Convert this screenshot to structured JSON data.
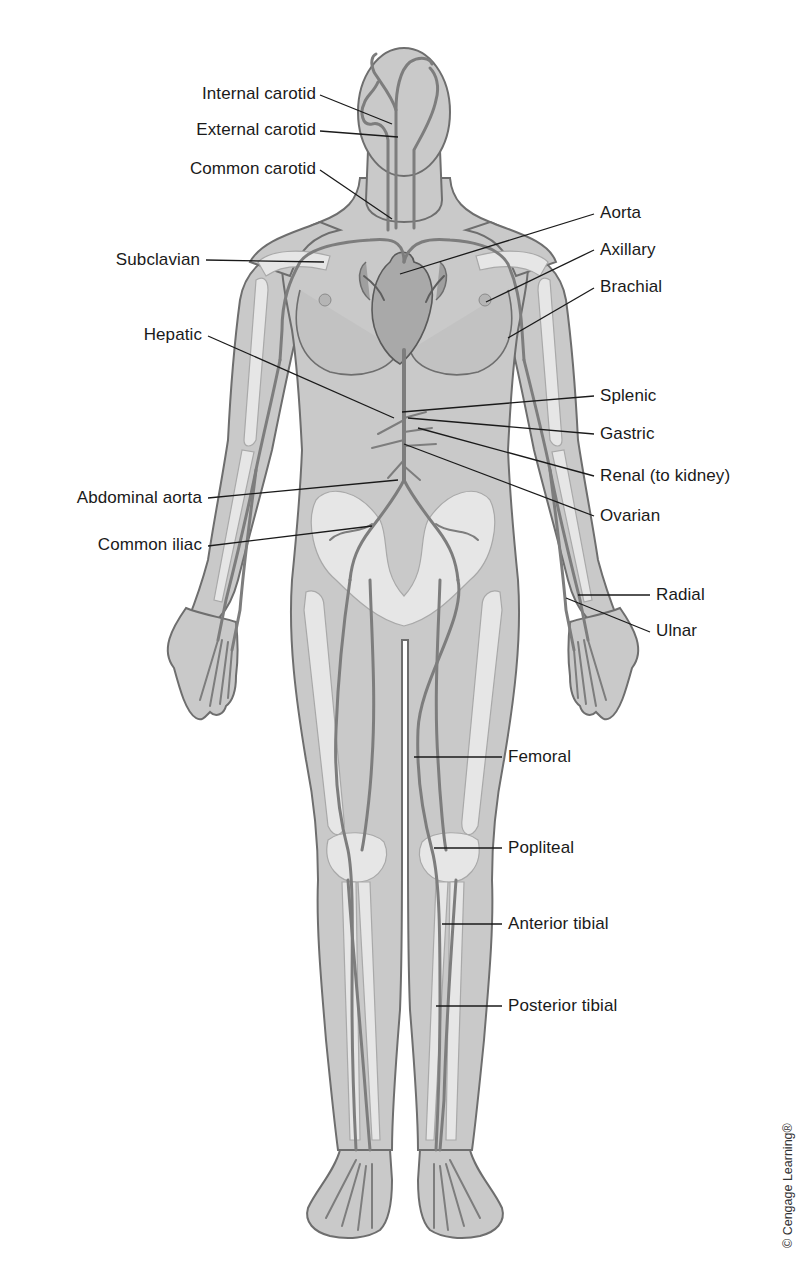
{
  "figure": {
    "credit": "© Cengage Learning®"
  },
  "labels": [
    {
      "id": "internal-carotid",
      "text": "Internal carotid",
      "side": "left"
    },
    {
      "id": "external-carotid",
      "text": "External carotid",
      "side": "left"
    },
    {
      "id": "common-carotid",
      "text": "Common carotid",
      "side": "left"
    },
    {
      "id": "subclavian",
      "text": "Subclavian",
      "side": "left"
    },
    {
      "id": "hepatic",
      "text": "Hepatic",
      "side": "left"
    },
    {
      "id": "abdominal-aorta",
      "text": "Abdominal aorta",
      "side": "left"
    },
    {
      "id": "common-iliac",
      "text": "Common iliac",
      "side": "left"
    },
    {
      "id": "aorta",
      "text": "Aorta",
      "side": "right"
    },
    {
      "id": "axillary",
      "text": "Axillary",
      "side": "right"
    },
    {
      "id": "brachial",
      "text": "Brachial",
      "side": "right"
    },
    {
      "id": "splenic",
      "text": "Splenic",
      "side": "right"
    },
    {
      "id": "gastric",
      "text": "Gastric",
      "side": "right"
    },
    {
      "id": "renal",
      "text": "Renal (to kidney)",
      "side": "right"
    },
    {
      "id": "ovarian",
      "text": "Ovarian",
      "side": "right"
    },
    {
      "id": "radial",
      "text": "Radial",
      "side": "right"
    },
    {
      "id": "ulnar",
      "text": "Ulnar",
      "side": "right"
    },
    {
      "id": "femoral",
      "text": "Femoral",
      "side": "right"
    },
    {
      "id": "popliteal",
      "text": "Popliteal",
      "side": "right"
    },
    {
      "id": "anterior-tibial",
      "text": "Anterior tibial",
      "side": "right"
    },
    {
      "id": "posterior-tibial",
      "text": "Posterior tibial",
      "side": "right"
    }
  ]
}
